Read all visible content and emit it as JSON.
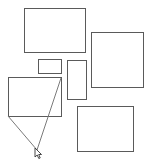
{
  "canvas": {
    "width": 148,
    "height": 165,
    "background": "#ffffff",
    "stroke_color": "#5a5a5a",
    "line_color": "#7a7a7a"
  },
  "shapes": [
    {
      "id": "rect-top",
      "x": 24,
      "y": 8,
      "w": 62,
      "h": 45
    },
    {
      "id": "rect-right",
      "x": 91,
      "y": 32,
      "w": 53,
      "h": 56
    },
    {
      "id": "rect-small",
      "x": 38,
      "y": 59,
      "w": 24,
      "h": 15
    },
    {
      "id": "rect-tall",
      "x": 67,
      "y": 60,
      "w": 20,
      "h": 40
    },
    {
      "id": "rect-left",
      "x": 8,
      "y": 77,
      "w": 54,
      "h": 40
    },
    {
      "id": "rect-bottom-right",
      "x": 77,
      "y": 106,
      "w": 57,
      "h": 46
    }
  ],
  "lines": [
    {
      "id": "line-from-top-right",
      "x1": 61,
      "y1": 78,
      "x2": 37,
      "y2": 150
    },
    {
      "id": "line-from-bottom-left",
      "x1": 8,
      "y1": 116,
      "x2": 37,
      "y2": 150
    }
  ],
  "cursor": {
    "icon": "arrow-cursor-icon",
    "x": 37,
    "y": 150
  }
}
